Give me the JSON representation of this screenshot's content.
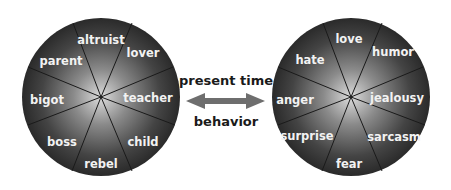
{
  "diagram": {
    "left_wheel": {
      "labels": [
        "altruist",
        "lover",
        "teacher",
        "child",
        "rebel",
        "boss",
        "bigot",
        "parent"
      ]
    },
    "right_wheel": {
      "labels": [
        "love",
        "humor",
        "jealousy",
        "sarcasm",
        "fear",
        "surprise",
        "anger",
        "hate"
      ]
    },
    "connector": {
      "top_label": "present time",
      "bottom_label": "behavior",
      "arrow": "double-headed-arrow"
    },
    "colors": {
      "wheel_dark": "#2e2e2e",
      "wheel_light": "#d8d8d8",
      "arrow": "#6e6e6e",
      "label_text": "#f2f2f2"
    }
  }
}
